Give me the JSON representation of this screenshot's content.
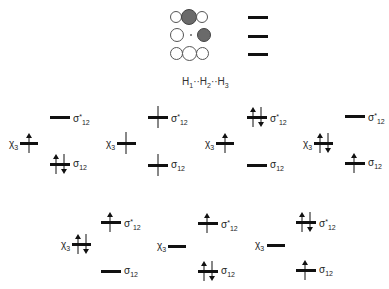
{
  "header": {
    "orbital_rows": [
      {
        "circles": [
          "open",
          "filled",
          "open"
        ],
        "middle_dot": false
      },
      {
        "circles": [
          "open",
          "dot",
          "filled"
        ],
        "middle_dot": true
      },
      {
        "circles": [
          "open",
          "open",
          "open"
        ],
        "middle_dot": false
      }
    ],
    "label_parts": [
      "H",
      "1",
      "··H",
      "2",
      "··H",
      "3"
    ]
  },
  "labels": {
    "chi": "χ",
    "chi_sub": "3",
    "sigma": "σ",
    "sigma_sub": "12",
    "star": "*"
  },
  "panels": [
    {
      "id": "r1p1",
      "occupancy": {
        "sigma_star": "empty",
        "chi3": "up",
        "sigma": "pair"
      }
    },
    {
      "id": "r1p2",
      "occupancy": {
        "sigma_star": "single-line",
        "chi3": "single-line",
        "sigma": "single-line"
      }
    },
    {
      "id": "r1p3",
      "occupancy": {
        "sigma_star": "pair",
        "chi3": "up",
        "sigma": "empty"
      }
    },
    {
      "id": "r1p4",
      "occupancy": {
        "sigma_star": "empty",
        "chi3": "pair",
        "sigma": "up"
      }
    },
    {
      "id": "r2p1",
      "occupancy": {
        "sigma_star": "up",
        "chi3": "pair",
        "sigma": "empty"
      }
    },
    {
      "id": "r2p2",
      "occupancy": {
        "sigma_star": "up",
        "chi3": "empty",
        "sigma": "pair"
      }
    },
    {
      "id": "r2p3",
      "occupancy": {
        "sigma_star": "pair",
        "chi3": "empty",
        "sigma": "up"
      }
    }
  ]
}
